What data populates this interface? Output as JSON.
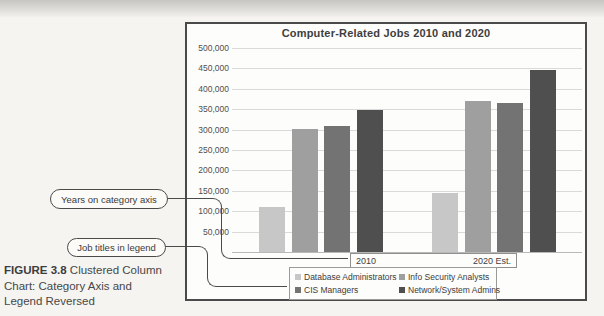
{
  "caption": {
    "prefix": "FIGURE 3.8",
    "line1": "Clustered Column",
    "line2": "Chart: Category Axis and",
    "line3": "Legend Reversed"
  },
  "callouts": {
    "years_label": "Years on category axis",
    "legend_label": "Job titles in legend"
  },
  "chart_data": {
    "type": "bar",
    "title": "Computer-Related Jobs 2010 and 2020",
    "categories": [
      "2010",
      "2020 Est."
    ],
    "series": [
      {
        "name": "Database Administrators",
        "color": "#c7c7c7",
        "values": [
          110000,
          145000
        ]
      },
      {
        "name": "Info Security Analysts",
        "color": "#9f9f9f",
        "values": [
          302000,
          370000
        ]
      },
      {
        "name": "CIS Managers",
        "color": "#737373",
        "values": [
          308000,
          365000
        ]
      },
      {
        "name": "Network/System Admins",
        "color": "#4f4f4f",
        "values": [
          347000,
          445000
        ]
      }
    ],
    "ylim": [
      0,
      500000
    ],
    "ytick_step": 50000,
    "ytick_labels": [
      "500,000",
      "450,000",
      "400,000",
      "350,000",
      "300,000",
      "250,000",
      "200,000",
      "150,000",
      "100,000",
      "50,000"
    ],
    "grid": true,
    "legend_position": "bottom"
  }
}
